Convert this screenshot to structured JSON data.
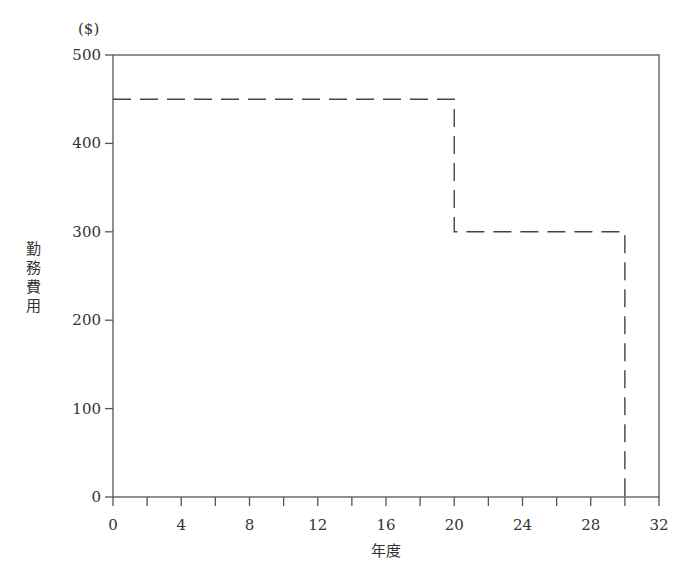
{
  "chart_data": {
    "type": "line",
    "title": "",
    "xlabel": "年度",
    "ylabel": "勤務費用",
    "yunit": "($)",
    "xlim": [
      0,
      32
    ],
    "ylim": [
      0,
      500
    ],
    "xticks": [
      0,
      4,
      8,
      12,
      16,
      20,
      24,
      28,
      32
    ],
    "xminor_step": 2,
    "yticks": [
      0,
      100,
      200,
      300,
      400,
      500
    ],
    "grid": false,
    "legend": null,
    "series": [
      {
        "name": "勤務費用",
        "style": "dashed",
        "step": true,
        "x": [
          0,
          20,
          20,
          30,
          30
        ],
        "y": [
          450,
          450,
          300,
          300,
          0
        ]
      }
    ]
  },
  "colors": {
    "axis": "#555555",
    "line": "#444444",
    "text": "#333333"
  }
}
